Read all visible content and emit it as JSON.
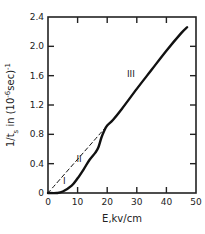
{
  "chart_data": {
    "type": "line",
    "title": "",
    "xlabel": "E, kv/cm",
    "ylabel": "1/t_s in (10^-6 sec)^-1",
    "xlim": [
      0,
      50
    ],
    "ylim": [
      0,
      2.4
    ],
    "x_ticks": [
      0,
      10,
      20,
      30,
      40,
      50
    ],
    "x_tick_labels": [
      "0",
      "10",
      "20",
      "30",
      "40",
      "50"
    ],
    "y_ticks": [
      0,
      0.4,
      0.8,
      1.2,
      1.6,
      2.0,
      2.4
    ],
    "y_tick_labels": [
      "0",
      "0.4",
      "0.8",
      "1.2",
      "1.6",
      "2.0",
      "2.4"
    ],
    "grid": false,
    "legend": null,
    "series": [
      {
        "name": "measured",
        "style": "solid",
        "x": [
          0,
          3,
          5,
          8,
          10,
          12,
          14,
          16,
          17,
          18,
          19,
          20,
          22,
          25,
          30,
          35,
          40,
          45,
          47
        ],
        "y": [
          0,
          0,
          0.02,
          0.1,
          0.2,
          0.32,
          0.45,
          0.55,
          0.62,
          0.75,
          0.85,
          0.92,
          1.0,
          1.15,
          1.42,
          1.68,
          1.94,
          2.18,
          2.26
        ]
      },
      {
        "name": "extrapolation",
        "style": "dashed",
        "x": [
          0,
          20
        ],
        "y": [
          0,
          0.92
        ]
      }
    ],
    "annotations": [
      {
        "text": "I",
        "x": 5.5,
        "y": 0.12
      },
      {
        "text": "II",
        "x": 10.5,
        "y": 0.42
      },
      {
        "text": "III",
        "x": 28,
        "y": 1.58
      }
    ]
  },
  "labels": {
    "xlabel": "E,kv/cm",
    "ylabel_main": "1/t",
    "ylabel_sub": "s",
    "ylabel_rest": " in (10",
    "ylabel_exp": "-6",
    "ylabel_end": "sec)",
    "ylabel_exp2": "-1"
  }
}
